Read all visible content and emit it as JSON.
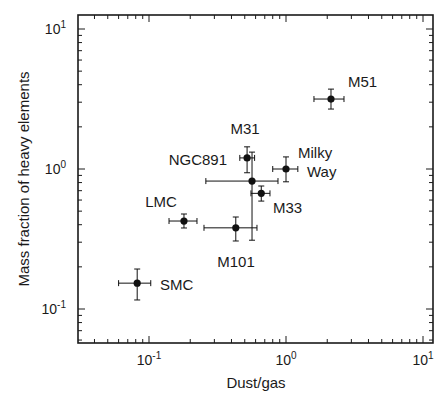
{
  "chart_data": {
    "type": "scatter",
    "title": "",
    "xlabel": "Dust/gas",
    "ylabel": "Mass fraction of heavy elements",
    "xscale": "log",
    "yscale": "log",
    "xlim": [
      0.031,
      11.8
    ],
    "ylim": [
      0.063,
      13.5
    ],
    "grid": false,
    "legend": null,
    "x_ticks": [
      {
        "value": 0.1,
        "base": "10",
        "exp": "-1"
      },
      {
        "value": 1,
        "base": "10",
        "exp": "0"
      },
      {
        "value": 10,
        "base": "10",
        "exp": "1"
      }
    ],
    "y_ticks": [
      {
        "value": 0.1,
        "base": "10",
        "exp": "-1"
      },
      {
        "value": 1,
        "base": "10",
        "exp": "0"
      },
      {
        "value": 10,
        "base": "10",
        "exp": "1"
      }
    ],
    "points": [
      {
        "name": "SMC",
        "x": 0.082,
        "y": 0.153,
        "x_err": [
          0.06,
          0.103
        ],
        "y_err": [
          0.116,
          0.193
        ],
        "label": "SMC",
        "label_pos": [
          160,
          290
        ],
        "anchor": "start"
      },
      {
        "name": "LMC",
        "x": 0.18,
        "y": 0.425,
        "x_err": [
          0.14,
          0.224
        ],
        "y_err": [
          0.379,
          0.477
        ],
        "label": "LMC",
        "label_pos": [
          161,
          207
        ],
        "anchor": "middle"
      },
      {
        "name": "M101",
        "x": 0.43,
        "y": 0.38,
        "x_err": [
          0.252,
          0.614
        ],
        "y_err": [
          0.306,
          0.454
        ],
        "label": "M101",
        "label_pos": [
          236,
          267
        ],
        "anchor": "middle"
      },
      {
        "name": "NGC891",
        "x": 0.565,
        "y": 0.82,
        "x_err": [
          0.26,
          0.874
        ],
        "y_err": [
          0.31,
          1.32
        ],
        "label": "NGC891",
        "label_pos": [
          227,
          165
        ],
        "anchor": "end"
      },
      {
        "name": "M31",
        "x": 0.52,
        "y": 1.2,
        "x_err": [
          0.46,
          0.59
        ],
        "y_err": [
          0.94,
          1.44
        ],
        "label": "M31",
        "label_pos": [
          245,
          134
        ],
        "anchor": "middle"
      },
      {
        "name": "M33",
        "x": 0.66,
        "y": 0.67,
        "x_err": [
          0.555,
          0.764
        ],
        "y_err": [
          0.59,
          0.756
        ],
        "label": "M33",
        "label_pos": [
          273,
          213
        ],
        "anchor": "start"
      },
      {
        "name": "Milky Way",
        "x": 1.0,
        "y": 1.0,
        "x_err": [
          0.8,
          1.22
        ],
        "y_err": [
          0.81,
          1.22
        ],
        "label": "Milky",
        "label2": "Way",
        "label_pos": [
          298,
          158
        ],
        "label2_pos": [
          307,
          177
        ],
        "anchor": "start"
      },
      {
        "name": "M51",
        "x": 2.13,
        "y": 3.16,
        "x_err": [
          1.6,
          2.65
        ],
        "y_err": [
          2.68,
          3.72
        ],
        "label": "M51",
        "label_pos": [
          348,
          87
        ],
        "anchor": "start"
      }
    ]
  },
  "colors": {
    "axis": "#1a1a1a",
    "marker": "#111111",
    "background": "#ffffff"
  }
}
